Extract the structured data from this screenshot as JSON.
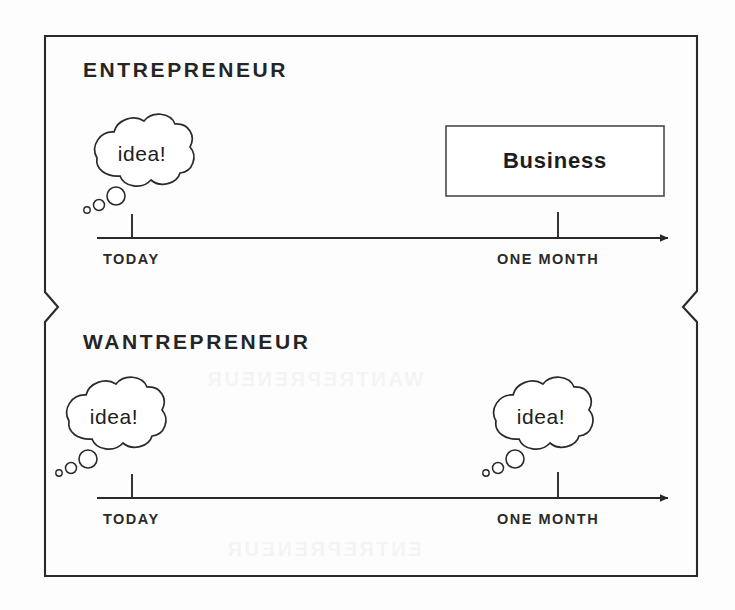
{
  "image": {
    "kind": "scanned-diagram",
    "background_color": "#fdfdfd",
    "ink_color": "#2a2a2a"
  },
  "panels": [
    {
      "id": "entrepreneur",
      "heading": "ENTREPRENEUR",
      "thought_bubbles": [
        {
          "id": "today-idea",
          "text": "idea!",
          "at_tick": "TODAY"
        }
      ],
      "outcome_box": {
        "label": "Business",
        "at_tick": "ONE MONTH"
      },
      "timeline": {
        "ticks": [
          {
            "label": "TODAY"
          },
          {
            "label": "ONE MONTH"
          }
        ],
        "arrow": "right"
      }
    },
    {
      "id": "wantrepreneur",
      "heading": "WANTREPRENEUR",
      "thought_bubbles": [
        {
          "id": "today-idea",
          "text": "idea!",
          "at_tick": "TODAY"
        },
        {
          "id": "one-month-idea",
          "text": "idea!",
          "at_tick": "ONE MONTH"
        }
      ],
      "outcome_box": null,
      "timeline": {
        "ticks": [
          {
            "label": "TODAY"
          },
          {
            "label": "ONE MONTH"
          }
        ],
        "arrow": "right"
      }
    }
  ],
  "bleed_through": {
    "top": "WANTREPRENEUR",
    "bottom": "ENTREPRENEUR"
  }
}
